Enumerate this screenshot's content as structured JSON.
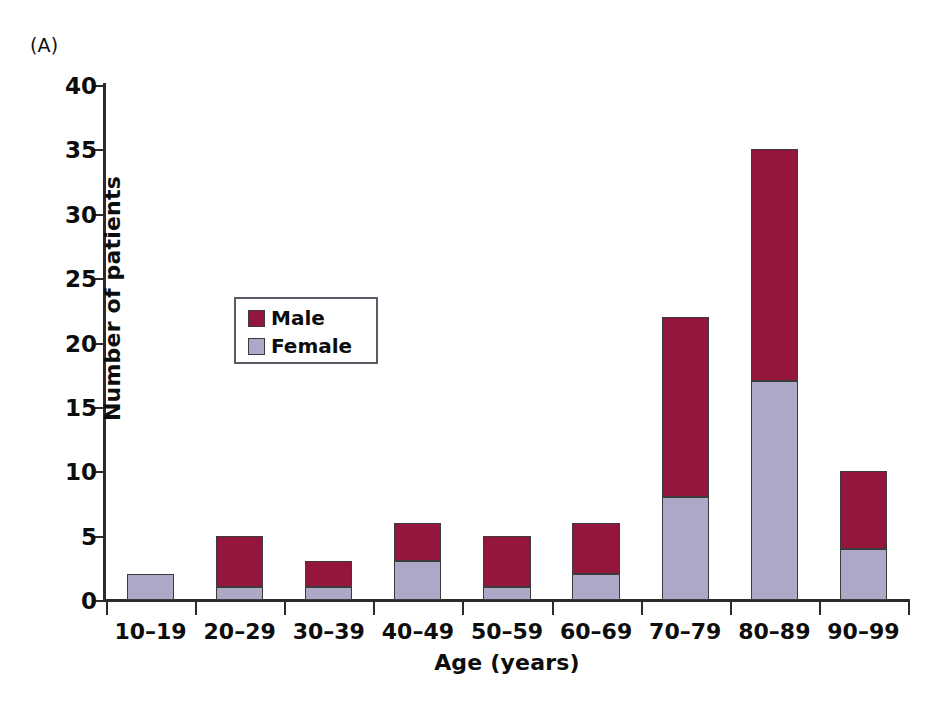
{
  "panel_label": "(A)",
  "colors": {
    "male": "#94163c",
    "female": "#ada8c8",
    "axis": "#2b2b2b",
    "text": "#0d0d0d",
    "legend_border": "#5b5b66",
    "background": "#ffffff"
  },
  "legend": {
    "position": "inside-upper-left",
    "entries": [
      {
        "label": "Male",
        "color": "#94163c"
      },
      {
        "label": "Female",
        "color": "#ada8c8"
      }
    ]
  },
  "chart_data": {
    "type": "bar",
    "subtype": "stacked-vertical",
    "title": "(A)",
    "xlabel": "Age (years)",
    "ylabel": "Number of patients",
    "categories": [
      "10–19",
      "20–29",
      "30–39",
      "40–49",
      "50–59",
      "60–69",
      "70–79",
      "80–89",
      "90–99"
    ],
    "series": [
      {
        "name": "Female",
        "color": "#ada8c8",
        "values": [
          2,
          1,
          1,
          3,
          1,
          2,
          8,
          17,
          4
        ]
      },
      {
        "name": "Male",
        "color": "#94163c",
        "values": [
          0,
          4,
          2,
          3,
          4,
          4,
          14,
          18,
          6
        ]
      }
    ],
    "totals": [
      2,
      5,
      3,
      6,
      5,
      6,
      22,
      35,
      10
    ],
    "ylim": [
      0,
      40
    ],
    "yticks": [
      0,
      5,
      10,
      15,
      20,
      25,
      30,
      35,
      40
    ],
    "ytick_labels": [
      "0",
      "5",
      "10",
      "15",
      "20",
      "25",
      "30",
      "35",
      "40"
    ],
    "grid": false,
    "legend_position": "upper left",
    "stack_order": [
      "Female",
      "Male"
    ]
  }
}
